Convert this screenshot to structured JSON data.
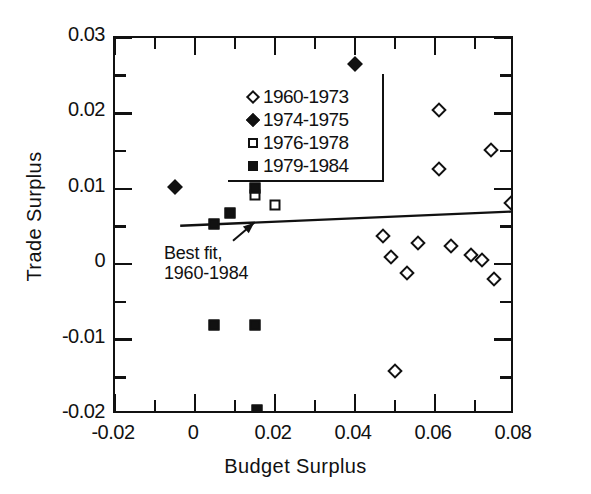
{
  "chart_data": {
    "type": "scatter",
    "title": "",
    "xlabel": "Budget Surplus",
    "ylabel": "Trade Surplus",
    "xlim": [
      -0.02,
      0.08
    ],
    "ylim": [
      -0.02,
      0.03
    ],
    "xticks": [
      "-0.02",
      "0",
      "0.02",
      "0.04",
      "0.06",
      "0.08"
    ],
    "xtick_values": [
      -0.02,
      0,
      0.02,
      0.04,
      0.06,
      0.08
    ],
    "xminor_values": [
      -0.01,
      0.01,
      0.03,
      0.05,
      0.07
    ],
    "yticks": [
      "0.03",
      "0.02",
      "0.01",
      "0",
      "-0.01",
      "-0.02"
    ],
    "ytick_values": [
      0.03,
      0.02,
      0.01,
      0,
      -0.01,
      -0.02
    ],
    "yminor_values": [
      0.025,
      0.015,
      0.005,
      -0.005,
      -0.015
    ],
    "grid": false,
    "legend_position": "top-left",
    "marker_color": "#111111",
    "series": [
      {
        "name": "1960-1973",
        "marker": "diamond-open",
        "points": [
          [
            0.034,
            0.0196
          ],
          [
            0.0375,
            0.0195
          ],
          [
            0.061,
            0.0205
          ],
          [
            0.074,
            0.0151
          ],
          [
            0.061,
            0.0126
          ],
          [
            0.079,
            0.0081
          ],
          [
            0.047,
            0.0037
          ],
          [
            0.0558,
            0.0028
          ],
          [
            0.064,
            0.0024
          ],
          [
            0.069,
            0.0012
          ],
          [
            0.0718,
            0.0006
          ],
          [
            0.049,
            0.0009
          ],
          [
            0.053,
            -0.0012
          ],
          [
            0.0748,
            -0.002
          ],
          [
            0.05,
            -0.0141
          ]
        ]
      },
      {
        "name": "1974-1975",
        "marker": "diamond-filled",
        "points": [
          [
            -0.005,
            0.0103
          ],
          [
            0.04,
            0.0266
          ]
        ]
      },
      {
        "name": "1976-1978",
        "marker": "square-open",
        "points": [
          [
            0.0165,
            0.014
          ],
          [
            0.015,
            0.0092
          ],
          [
            0.02,
            0.0078
          ]
        ]
      },
      {
        "name": "1979-1984",
        "marker": "square-filled",
        "points": [
          [
            0.015,
            0.0101
          ],
          [
            0.0088,
            0.0068
          ],
          [
            0.0048,
            0.0053
          ],
          [
            0.0048,
            -0.0081
          ],
          [
            0.015,
            -0.0081
          ],
          [
            0.0155,
            -0.0193
          ]
        ]
      }
    ],
    "fit_line": {
      "label_line1": "Best fit,",
      "label_line2": "1960-1984",
      "x_start": -0.0037,
      "y_start": 0.0051,
      "x_end": 0.08,
      "y_end": 0.007
    },
    "annotation_arrow": {
      "from_x": 0.0095,
      "from_y": 0.0031,
      "to_x": 0.0148,
      "to_y": 0.0055
    }
  },
  "legend": {
    "items": [
      {
        "label": "1960-1973",
        "marker": "diamond-open"
      },
      {
        "label": "1974-1975",
        "marker": "diamond-filled"
      },
      {
        "label": "1976-1978",
        "marker": "square-open"
      },
      {
        "label": "1979-1984",
        "marker": "square-filled"
      }
    ]
  }
}
